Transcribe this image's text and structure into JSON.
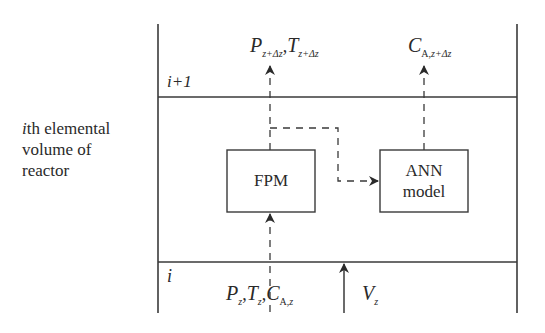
{
  "side_label": {
    "line1_italic": "i",
    "line1_rest": "th elemental",
    "line2": "volume of",
    "line3": "reactor"
  },
  "boundaries": {
    "upper": "i+1",
    "lower": "i"
  },
  "blocks": {
    "fpm": "FPM",
    "ann_line1": "ANN",
    "ann_line2": "model"
  },
  "outputs": {
    "P": "P",
    "P_sub": "z+Δz",
    "T": "T",
    "T_sub": "z+Δz",
    "C": "C",
    "C_sub_A": "A,",
    "C_sub_z": "z+Δz",
    "sep": ","
  },
  "inputs": {
    "P": "P",
    "P_sub": "z",
    "T": "T",
    "T_sub": "z",
    "C": "C",
    "C_sub_A": "A,",
    "C_sub_z": "z",
    "sep": ",",
    "V": "V",
    "V_sub": "z"
  },
  "colors": {
    "line": "#3a3a3a",
    "text": "#2a2a2a",
    "background": "#ffffff"
  }
}
